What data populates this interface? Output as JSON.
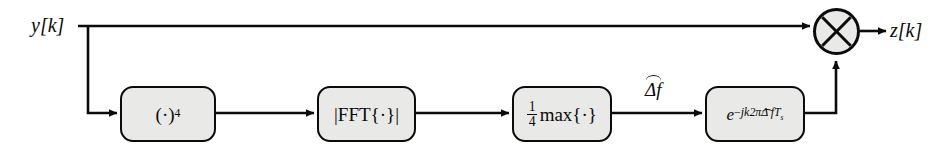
{
  "diagram": {
    "type": "signal-flow-block-diagram",
    "colors": {
      "background": "#ffffff",
      "block_fill": "#e9e9e7",
      "stroke": "#0b0b0b"
    },
    "signals": {
      "input_label": "y[k]",
      "output_label": "z[k]",
      "estimate_label": "Δf",
      "estimate_has_hat": true
    },
    "blocks": [
      {
        "id": "power4",
        "name": "fourth-power-block",
        "label_text": "(·)4",
        "base": "(·)",
        "exponent": "4"
      },
      {
        "id": "fftmag",
        "name": "fft-magnitude-block",
        "label_text": "|FFT{·}|",
        "body": "|FFT{·}|"
      },
      {
        "id": "quartermax",
        "name": "quarter-max-block",
        "label_text": "1/4 max{·}",
        "numerator": "1",
        "denominator": "4",
        "operator": "max{·}"
      },
      {
        "id": "derotate",
        "name": "frequency-derotation-block",
        "label_text": "e^-jk2πΔf Ts",
        "base": "e",
        "exp_sign": "−",
        "exp_body": "jk2π",
        "exp_hat_var": "Δ f",
        "exp_tail": "T",
        "exp_tail_sub": "s"
      }
    ],
    "multiplier": {
      "name": "multiplier-node",
      "symbol": "×",
      "glyph": "circle-with-cross"
    }
  }
}
